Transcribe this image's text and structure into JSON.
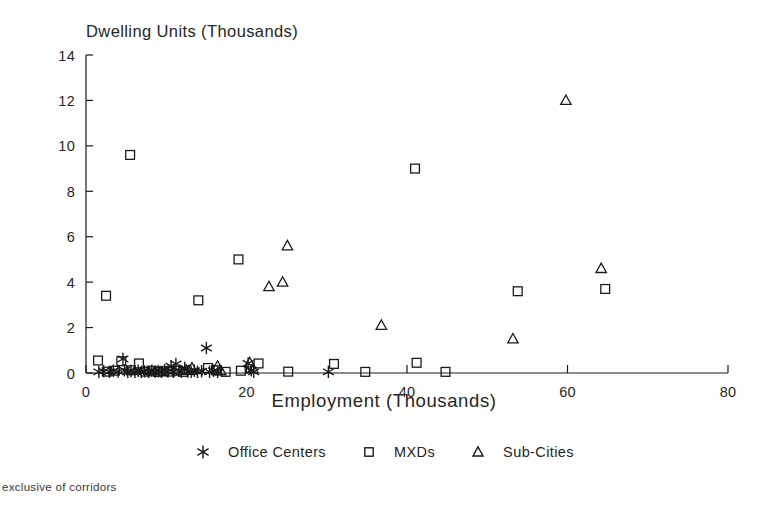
{
  "chart_data": {
    "type": "scatter",
    "title": "Dwelling Units (Thousands)",
    "xlabel": "Employment (Thousands)",
    "ylabel": "Dwelling Units (Thousands)",
    "footnote": "exclusive of corridors",
    "xlim": [
      0,
      80
    ],
    "ylim": [
      0,
      14
    ],
    "xticks": [
      0,
      20,
      40,
      60,
      80
    ],
    "yticks": [
      0,
      2,
      4,
      6,
      8,
      10,
      12,
      14
    ],
    "grid": false,
    "legend_position": "below-axis",
    "series": [
      {
        "name": "Office Centers",
        "marker": "asterisk",
        "color": "#1a1a1a",
        "points": [
          [
            1.6,
            0.05
          ],
          [
            2.2,
            0.08
          ],
          [
            2.9,
            0.05
          ],
          [
            3.4,
            0.1
          ],
          [
            4.0,
            0.06
          ],
          [
            4.6,
            0.62
          ],
          [
            4.8,
            0.12
          ],
          [
            5.2,
            0.05
          ],
          [
            5.6,
            0.09
          ],
          [
            6.1,
            0.05
          ],
          [
            6.5,
            0.1
          ],
          [
            6.9,
            0.05
          ],
          [
            7.3,
            0.07
          ],
          [
            7.8,
            0.05
          ],
          [
            8.2,
            0.1
          ],
          [
            8.6,
            0.05
          ],
          [
            9.0,
            0.08
          ],
          [
            9.4,
            0.05
          ],
          [
            9.8,
            0.12
          ],
          [
            10.2,
            0.06
          ],
          [
            10.6,
            0.3
          ],
          [
            10.9,
            0.05
          ],
          [
            11.2,
            0.4
          ],
          [
            11.6,
            0.1
          ],
          [
            11.9,
            0.05
          ],
          [
            12.3,
            0.22
          ],
          [
            12.7,
            0.06
          ],
          [
            13.1,
            0.05
          ],
          [
            13.5,
            0.1
          ],
          [
            13.9,
            0.05
          ],
          [
            14.4,
            0.08
          ],
          [
            15.0,
            1.1
          ],
          [
            15.4,
            0.05
          ],
          [
            15.9,
            0.1
          ],
          [
            16.4,
            0.05
          ],
          [
            20.2,
            0.42
          ],
          [
            20.6,
            0.12
          ],
          [
            20.9,
            0.05
          ],
          [
            30.2,
            0.05
          ]
        ]
      },
      {
        "name": "MXDs",
        "marker": "square",
        "color": "#1a1a1a",
        "points": [
          [
            1.5,
            0.55
          ],
          [
            2.5,
            3.4
          ],
          [
            2.6,
            0.06
          ],
          [
            3.6,
            0.1
          ],
          [
            4.4,
            0.52
          ],
          [
            5.5,
            9.6
          ],
          [
            5.6,
            0.12
          ],
          [
            6.6,
            0.42
          ],
          [
            7.4,
            0.06
          ],
          [
            8.2,
            0.1
          ],
          [
            9.0,
            0.05
          ],
          [
            9.7,
            0.08
          ],
          [
            10.5,
            0.06
          ],
          [
            11.3,
            0.1
          ],
          [
            12.1,
            0.05
          ],
          [
            14.0,
            3.2
          ],
          [
            15.2,
            0.22
          ],
          [
            16.2,
            0.12
          ],
          [
            17.4,
            0.05
          ],
          [
            19.0,
            5.0
          ],
          [
            19.3,
            0.1
          ],
          [
            21.5,
            0.42
          ],
          [
            25.2,
            0.06
          ],
          [
            30.9,
            0.4
          ],
          [
            34.8,
            0.05
          ],
          [
            41.0,
            9.0
          ],
          [
            41.2,
            0.45
          ],
          [
            44.8,
            0.05
          ],
          [
            53.8,
            3.6
          ],
          [
            64.7,
            3.7
          ]
        ]
      },
      {
        "name": "Sub-Cities",
        "marker": "triangle",
        "color": "#1a1a1a",
        "points": [
          [
            12.5,
            0.12
          ],
          [
            13.2,
            0.22
          ],
          [
            16.4,
            0.3
          ],
          [
            16.8,
            0.1
          ],
          [
            20.4,
            0.45
          ],
          [
            20.8,
            0.18
          ],
          [
            22.8,
            3.8
          ],
          [
            24.5,
            4.0
          ],
          [
            25.1,
            5.6
          ],
          [
            36.8,
            2.1
          ],
          [
            53.2,
            1.5
          ],
          [
            59.8,
            12.0
          ],
          [
            64.2,
            4.6
          ]
        ]
      }
    ]
  },
  "legend": {
    "entries": [
      {
        "label": "Office Centers",
        "marker": "asterisk-marker"
      },
      {
        "label": "MXDs",
        "marker": "square-marker"
      },
      {
        "label": "Sub-Cities",
        "marker": "triangle-marker"
      }
    ]
  }
}
